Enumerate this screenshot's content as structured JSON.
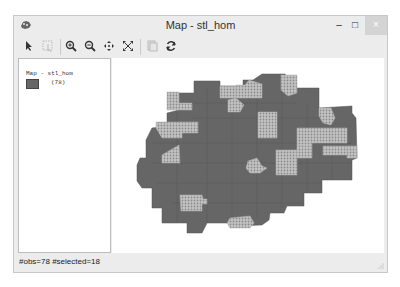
{
  "window": {
    "title": "Map - stl_hom",
    "controls": {
      "minimize": "–",
      "maximize": "□",
      "close": "×"
    }
  },
  "toolbar": {
    "items": [
      {
        "name": "select-tool",
        "icon": "pointer-icon"
      },
      {
        "name": "select-rect-tool",
        "icon": "select-region-icon",
        "disabled": true
      },
      {
        "name": "zoom-in",
        "icon": "zoom-in-icon"
      },
      {
        "name": "zoom-out",
        "icon": "zoom-out-icon"
      },
      {
        "name": "pan",
        "icon": "pan-icon"
      },
      {
        "name": "full-extent",
        "icon": "full-extent-icon"
      },
      {
        "name": "copy-map",
        "icon": "copy-icon",
        "disabled": true
      },
      {
        "name": "refresh",
        "icon": "refresh-icon"
      }
    ]
  },
  "legend": {
    "title": "Map - stl_hom",
    "items": [
      {
        "label": "(78)",
        "color": "#666666"
      }
    ]
  },
  "map": {
    "fill_color": "#666666",
    "selected_pattern_color": "#a8a8a8",
    "total_polygons": 78,
    "selected_polygons": 18
  },
  "status": {
    "text": "#obs=78 #selected=18"
  }
}
